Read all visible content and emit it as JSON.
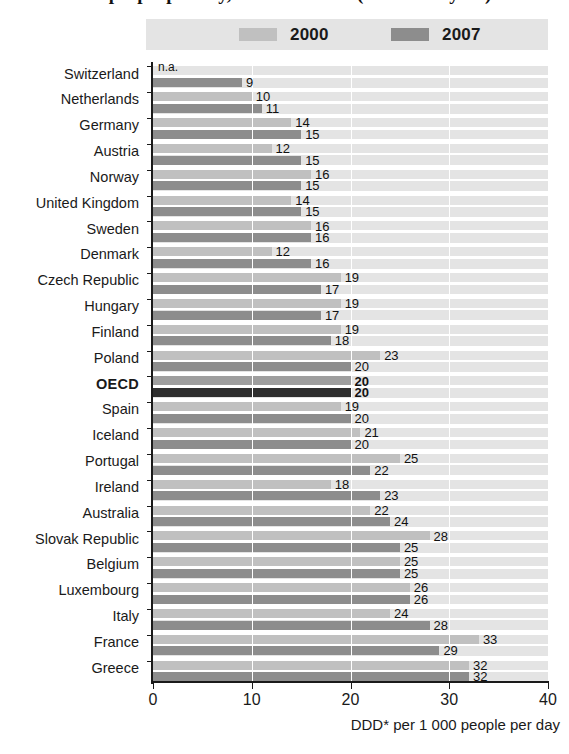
{
  "title": "use people per day, 2000 and 2007 (or nearest year)",
  "legend": {
    "items": [
      {
        "label": "2000",
        "color": "#c0c0c0",
        "key": "y2000"
      },
      {
        "label": "2007",
        "color": "#8d8d8d",
        "key": "y2007"
      }
    ]
  },
  "axis": {
    "x_ticks": [
      "0",
      "10",
      "20",
      "30",
      "40"
    ],
    "x_title": "DDD* per 1 000 people per day"
  },
  "chart_data": {
    "type": "bar",
    "orientation": "horizontal",
    "title": "use people per day, 2000 and 2007 (or nearest year)",
    "xlabel": "DDD* per 1 000 people per day",
    "ylabel": "",
    "xlim": [
      0,
      40
    ],
    "xticks": [
      0,
      10,
      20,
      30,
      40
    ],
    "grid": "vertical",
    "legend_position": "top",
    "categories": [
      "Switzerland",
      "Netherlands",
      "Germany",
      "Austria",
      "Norway",
      "United Kingdom",
      "Sweden",
      "Denmark",
      "Czech Republic",
      "Hungary",
      "Finland",
      "Poland",
      "OECD",
      "Spain",
      "Iceland",
      "Portugal",
      "Ireland",
      "Australia",
      "Slovak Republic",
      "Belgium",
      "Luxembourg",
      "Italy",
      "France",
      "Greece"
    ],
    "series": [
      {
        "name": "2000",
        "color": "#c0c0c0",
        "values": [
          null,
          10,
          14,
          12,
          16,
          14,
          16,
          12,
          19,
          19,
          19,
          23,
          20,
          19,
          21,
          25,
          18,
          22,
          28,
          25,
          26,
          24,
          33,
          32
        ],
        "labels": [
          "n.a.",
          "10",
          "14",
          "12",
          "16",
          "14",
          "16",
          "12",
          "19",
          "19",
          "19",
          "23",
          "20",
          "19",
          "21",
          "25",
          "18",
          "22",
          "28",
          "25",
          "26",
          "24",
          "33",
          "32"
        ]
      },
      {
        "name": "2007",
        "color": "#8d8d8d",
        "values": [
          9,
          11,
          15,
          15,
          15,
          15,
          16,
          16,
          17,
          17,
          18,
          20,
          20,
          20,
          20,
          22,
          23,
          24,
          25,
          25,
          26,
          28,
          29,
          32
        ],
        "labels": [
          "9",
          "11",
          "15",
          "15",
          "15",
          "15",
          "16",
          "16",
          "17",
          "17",
          "18",
          "20",
          "20",
          "20",
          "20",
          "22",
          "23",
          "24",
          "25",
          "25",
          "26",
          "28",
          "29",
          "32"
        ]
      }
    ],
    "highlight_category": "OECD",
    "highlight_colors": {
      "2000": "#9e9e9e",
      "2007": "#2e2e2e"
    }
  }
}
